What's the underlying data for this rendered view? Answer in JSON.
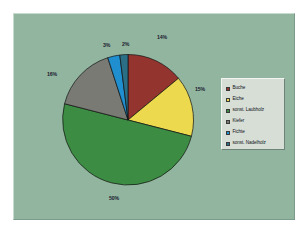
{
  "figure": {
    "background_color": "#92b5a0",
    "page_color": "#ffffff"
  },
  "chart_data": {
    "type": "pie",
    "title": "",
    "subtitle": "",
    "xlabel": "",
    "ylabel": "",
    "grid": false,
    "legend_position": "right",
    "start_angle_deg": 0,
    "direction": "clockwise",
    "categories": [
      "Buche",
      "Eiche",
      "sonst. Laubholz",
      "Kiefer",
      "Fichte",
      "sonst. Nadelholz"
    ],
    "values": [
      14,
      15,
      50,
      16,
      3,
      2
    ],
    "labels": [
      "14%",
      "15%",
      "50%",
      "16%",
      "3%",
      "2%"
    ],
    "colors": [
      "#93342e",
      "#ecd94e",
      "#3c8c43",
      "#7a7a74",
      "#1f8fd0",
      "#2a6f86"
    ],
    "slices": [
      {
        "name": "Buche",
        "value": 14,
        "label": "14%",
        "color": "#93342e"
      },
      {
        "name": "Eiche",
        "value": 15,
        "label": "15%",
        "color": "#ecd94e"
      },
      {
        "name": "sonst. Laubholz",
        "value": 50,
        "label": "50%",
        "color": "#3c8c43"
      },
      {
        "name": "Kiefer",
        "value": 16,
        "label": "16%",
        "color": "#7a7a74"
      },
      {
        "name": "Fichte",
        "value": 3,
        "label": "3%",
        "color": "#1f8fd0"
      },
      {
        "name": "sonst. Nadelholz",
        "value": 2,
        "label": "2%",
        "color": "#2a6f86"
      }
    ]
  },
  "legend": {
    "items": [
      {
        "label": "Buche",
        "color": "#93342e"
      },
      {
        "label": "Eiche",
        "color": "#ecd94e"
      },
      {
        "label": "sonst. Laubholz",
        "color": "#3c8c43"
      },
      {
        "label": "Kiefer",
        "color": "#7a7a74"
      },
      {
        "label": "Fichte",
        "color": "#1f8fd0"
      },
      {
        "label": "sonst. Nadelholz",
        "color": "#2a6f86"
      }
    ]
  },
  "pct_labels": {
    "buche": "14%",
    "eiche": "15%",
    "sonst_laubholz": "50%",
    "kiefer": "16%",
    "fichte": "3%",
    "sonst_nadelholz": "2%"
  }
}
